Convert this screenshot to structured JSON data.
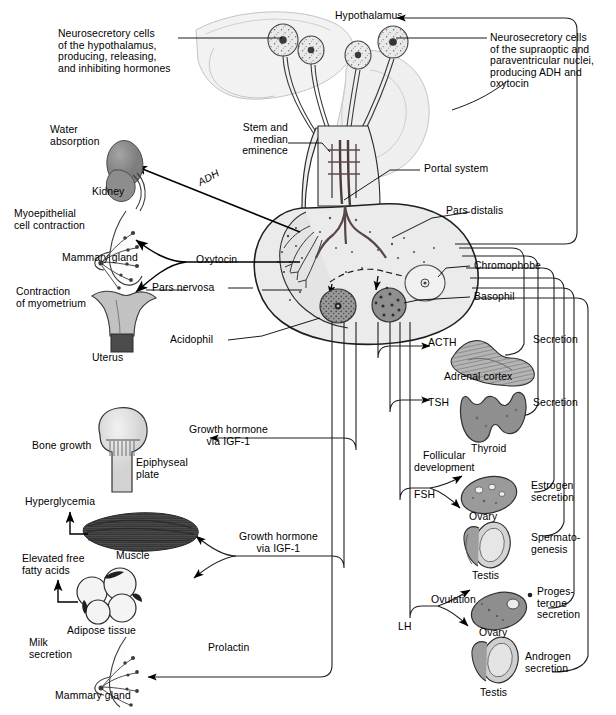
{
  "figure": {
    "domain": "Diagram",
    "background": "#ffffff",
    "ink": "#000000",
    "organ_fill_dark": "#8c8c8c",
    "organ_fill_light": "#d9d9d9",
    "gland_fill": "#e8e8e8",
    "brain_fill": "#f0f0f0"
  },
  "labels": {
    "hypothalamus": "Hypothalamus",
    "neurosecretory_left": "Neurosecretory cells\nof the hypothalamus,\nproducing, releasing,\nand inhibiting hormones",
    "neurosecretory_right": "Neurosecretory cells\nof the supraoptic and\nparaventricular nuclei,\nproducing ADH and\noxytocin",
    "stem_median_eminence": "Stem and\nmedian\neminence",
    "portal_system": "Portal system",
    "pars_distalis": "Pars distalis",
    "pars_nervosa": "Pars nervosa",
    "chromophobe": "Chromophobe",
    "basophil": "Basophil",
    "acidophil": "Acidophil",
    "water_absorption": "Water\nabsorption",
    "kidney": "Kidney",
    "adh": "ADH",
    "myoepithelial": "Myoepithelial\ncell contraction",
    "mammary_gland_top": "Mammary gland",
    "oxytocin": "Oxytocin",
    "contraction_myometrium": "Contraction\nof myometrium",
    "uterus": "Uterus",
    "acth": "ACTH",
    "adrenal_cortex": "Adrenal cortex",
    "secretion_adrenal": "Secretion",
    "tsh": "TSH",
    "thyroid": "Thyroid",
    "secretion_thyroid": "Secretion",
    "follicular_development": "Follicular\ndevelopment",
    "fsh": "FSH",
    "ovary_fsh": "Ovary",
    "estrogen_secretion": "Estrogen\nsecretion",
    "testis_fsh": "Testis",
    "spermatogenesis": "Spermato-\ngenesis",
    "ovulation": "Ovulation",
    "lh": "LH",
    "ovary_lh": "Ovary",
    "progesterone_secretion": "Proges-\nterone\nsecretion",
    "testis_lh": "Testis",
    "androgen_secretion": "Androgen\nsecretion",
    "growth_hormone_bone": "Growth hormone\nvia IGF-1",
    "growth_hormone_muscle": "Growth hormone\nvia IGF-1",
    "bone_growth": "Bone growth",
    "epiphyseal_plate": "Epiphyseal\nplate",
    "hyperglycemia": "Hyperglycemia",
    "muscle": "Muscle",
    "elevated_ffa": "Elevated free\nfatty acids",
    "adipose_tissue": "Adipose tissue",
    "prolactin": "Prolactin",
    "milk_secretion": "Milk\nsecretion",
    "mammary_gland_bottom": "Mammary gland"
  },
  "hormone_axes": [
    {
      "hormone": "ADH",
      "source": "Pars nervosa",
      "target": "Kidney",
      "effect": "Water absorption"
    },
    {
      "hormone": "Oxytocin",
      "source": "Pars nervosa",
      "target": "Mammary gland",
      "effect": "Myoepithelial cell contraction"
    },
    {
      "hormone": "Oxytocin",
      "source": "Pars nervosa",
      "target": "Uterus",
      "effect": "Contraction of myometrium"
    },
    {
      "hormone": "ACTH",
      "source": "Pars distalis",
      "target": "Adrenal cortex",
      "effect": "Secretion"
    },
    {
      "hormone": "TSH",
      "source": "Pars distalis",
      "target": "Thyroid",
      "effect": "Secretion"
    },
    {
      "hormone": "FSH",
      "source": "Pars distalis",
      "target": "Ovary",
      "effect": "Follicular development, Estrogen secretion"
    },
    {
      "hormone": "FSH",
      "source": "Pars distalis",
      "target": "Testis",
      "effect": "Spermatogenesis"
    },
    {
      "hormone": "LH",
      "source": "Pars distalis",
      "target": "Ovary",
      "effect": "Ovulation, Progesterone secretion"
    },
    {
      "hormone": "LH",
      "source": "Pars distalis",
      "target": "Testis",
      "effect": "Androgen secretion"
    },
    {
      "hormone": "Growth hormone via IGF-1",
      "source": "Pars distalis",
      "target": "Bone",
      "effect": "Bone growth at epiphyseal plate"
    },
    {
      "hormone": "Growth hormone via IGF-1",
      "source": "Pars distalis",
      "target": "Muscle",
      "effect": "Hyperglycemia"
    },
    {
      "hormone": "Growth hormone via IGF-1",
      "source": "Pars distalis",
      "target": "Adipose tissue",
      "effect": "Elevated free fatty acids"
    },
    {
      "hormone": "Prolactin",
      "source": "Pars distalis",
      "target": "Mammary gland",
      "effect": "Milk secretion"
    }
  ],
  "cell_types": [
    "Acidophil",
    "Basophil",
    "Chromophobe"
  ]
}
